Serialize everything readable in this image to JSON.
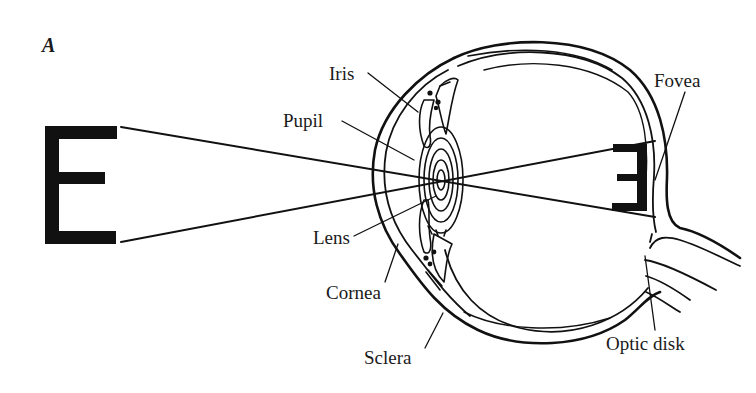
{
  "figure": {
    "panel_label": "A",
    "stimulus_letter": "E",
    "retinal_image_letter": "E",
    "retinal_image_orientation": "inverted / mirrored",
    "colors": {
      "background": "#ffffff",
      "ink": "#111111"
    }
  },
  "labels": {
    "iris": "Iris",
    "pupil": "Pupil",
    "lens": "Lens",
    "cornea": "Cornea",
    "sclera": "Sclera",
    "fovea": "Fovea",
    "optic_disk": "Optic disk"
  }
}
